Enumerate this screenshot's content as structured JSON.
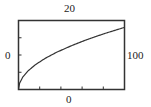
{
  "chart_data": {
    "type": "line",
    "title": "",
    "xlabel": "",
    "ylabel": "",
    "xlim": [
      0,
      100
    ],
    "ylim": [
      0,
      20
    ],
    "window_labels": {
      "ymax": "20",
      "xmin": "0",
      "xmax": "100",
      "ymin": "0"
    },
    "x_ticks_count": 5,
    "y_ticks_count": 4,
    "grid": false,
    "legend": null,
    "series": [
      {
        "name": "curve",
        "description": "square-root shaped increasing curve, approx y = 1.8*sqrt(x)",
        "x": [
          0,
          1,
          4,
          9,
          16,
          25,
          36,
          50,
          64,
          81,
          100
        ],
        "values": [
          0,
          1.8,
          3.6,
          5.4,
          7.2,
          9.0,
          10.8,
          12.7,
          14.4,
          16.2,
          18.0
        ]
      }
    ]
  },
  "colors": {
    "frame": "#333333",
    "curve": "#333333",
    "background": "#ffffff"
  }
}
